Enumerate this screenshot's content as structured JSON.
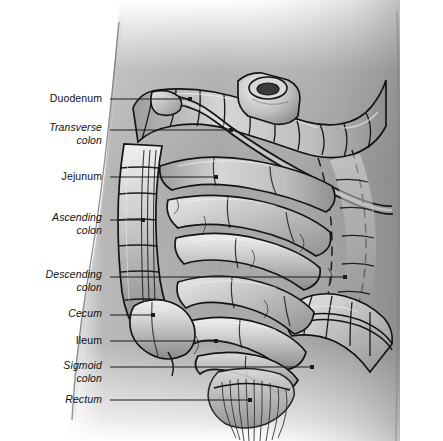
{
  "figure": {
    "view": "anterior view of abdomen with small and large intestine in situ",
    "style": "grayscale medical line-and-tone illustration",
    "canvas": {
      "width": 443,
      "height": 441
    },
    "colors": {
      "background": "#ffffff",
      "torso": "#a7a7a7",
      "torso_shadow": "#8e8e8e",
      "organ_light": "#e0e0e0",
      "organ_mid": "#bcbcbc",
      "organ_dark": "#8c8c8c",
      "outline": "#1a1a1a",
      "leader_line": "#1a1a1a",
      "label_text": "#111111"
    }
  },
  "labels": [
    {
      "id": "duodenum",
      "text": "Duodenum",
      "text2": "",
      "style": "upright",
      "x": 102,
      "y": 99,
      "line_to_x": 190,
      "line_y": 99,
      "dot": true
    },
    {
      "id": "transverse-colon",
      "text": "Transverse",
      "text2": "colon",
      "style": "italic",
      "x": 102,
      "y": 128,
      "line_to_x": 231,
      "line_y": 130,
      "dot": true
    },
    {
      "id": "jejunum",
      "text": "Jejunum",
      "text2": "",
      "style": "upright",
      "x": 102,
      "y": 177,
      "line_to_x": 216,
      "line_y": 177,
      "dot": true
    },
    {
      "id": "ascending-colon",
      "text": "Ascending",
      "text2": "colon",
      "style": "italic",
      "x": 102,
      "y": 218,
      "line_to_x": 143,
      "line_y": 220,
      "dot": true
    },
    {
      "id": "descending-colon",
      "text": "Descending",
      "text2": "colon",
      "style": "italic",
      "x": 102,
      "y": 275,
      "line_to_x": 345,
      "line_y": 277,
      "dot": true
    },
    {
      "id": "cecum",
      "text": "Cecum",
      "text2": "",
      "style": "italic",
      "x": 102,
      "y": 314,
      "line_to_x": 153,
      "line_y": 315,
      "dot": true
    },
    {
      "id": "ileum",
      "text": "Ileum",
      "text2": "",
      "style": "upright",
      "x": 102,
      "y": 341,
      "line_to_x": 216,
      "line_y": 341,
      "dot": true
    },
    {
      "id": "sigmoid-colon",
      "text": "Sigmoid",
      "text2": "colon",
      "style": "italic",
      "x": 102,
      "y": 366,
      "line_to_x": 312,
      "line_y": 367,
      "dot": true
    },
    {
      "id": "rectum",
      "text": "Rectum",
      "text2": "",
      "style": "italic",
      "x": 102,
      "y": 400,
      "line_to_x": 250,
      "line_y": 400,
      "dot": true
    }
  ],
  "structures": [
    {
      "name": "stomach-pylorus-stump",
      "note": "cut tubular stump at upper centre"
    },
    {
      "name": "duodenum",
      "note": "C-shaped tube behind transverse colon"
    },
    {
      "name": "transverse-colon",
      "note": "haustrated arch across upper abdomen"
    },
    {
      "name": "ascending-colon",
      "note": "haustrated column on right side of image-left"
    },
    {
      "name": "descending-colon",
      "note": "dashed hidden outline on image-right"
    },
    {
      "name": "cecum",
      "note": "blind pouch lower image-left"
    },
    {
      "name": "jejunum",
      "note": "coiled loops upper central"
    },
    {
      "name": "ileum",
      "note": "coiled loops lower central"
    },
    {
      "name": "sigmoid-colon",
      "note": "S-shaped loop lower image-right"
    },
    {
      "name": "rectum",
      "note": "fan of striations at lower centre"
    }
  ]
}
